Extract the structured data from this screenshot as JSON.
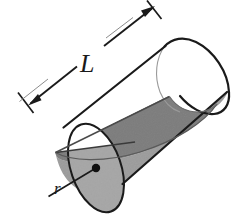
{
  "figure": {
    "name": "cylinder-diagram",
    "type": "geometric-solid",
    "labels": {
      "length": "L",
      "radius": "r"
    },
    "annotations": {
      "length_dimension": "double-headed dimension arrow spanning the slant length of the cylinder, labelled L",
      "radius_dimension": "radius segment from centre dot to the circular rim of the near end face, labelled r",
      "center_dot": "filled black dot marking the centre of the near circular end face"
    },
    "colors": {
      "background": "#ffffff",
      "outline": "#1a1a1a",
      "hidden_edge": "#9a9a9a",
      "cut_plane_fill": "#b4b4b4",
      "body_shade_fill": "#c9c9c9",
      "near_face_fill": "#cfcfcf",
      "label_color": "#1a1a1a"
    },
    "geometry": {
      "near_face_center": [
        96,
        168
      ],
      "near_face_rx": 46,
      "near_face_ry": 25,
      "far_face_center": [
        196,
        80
      ],
      "far_face_rx": 46,
      "far_face_ry": 25,
      "axis_angle_deg": -41,
      "radius_endpoint": [
        48,
        196
      ]
    }
  }
}
